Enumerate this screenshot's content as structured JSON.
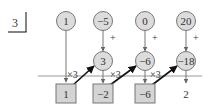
{
  "divisor": "3",
  "top_row": [
    {
      "value": "1",
      "x": 66
    },
    {
      "value": "−5",
      "x": 103
    },
    {
      "value": "0",
      "x": 145
    },
    {
      "value": "20",
      "x": 186
    }
  ],
  "middle_row": [
    {
      "value": "3",
      "x": 103
    },
    {
      "value": "−6",
      "x": 145
    },
    {
      "value": "−18",
      "x": 186
    }
  ],
  "bottom_row": [
    {
      "value": "1",
      "x": 66
    },
    {
      "value": "−2",
      "x": 103
    },
    {
      "value": "−6",
      "x": 145
    }
  ],
  "remainder": "2",
  "plus_label": "+",
  "multiply_label": "×3",
  "colors": {
    "fill": "#dcdcdc",
    "stroke": "#777777",
    "line": "#888888",
    "arrow": "#222222",
    "text": "#333333"
  }
}
